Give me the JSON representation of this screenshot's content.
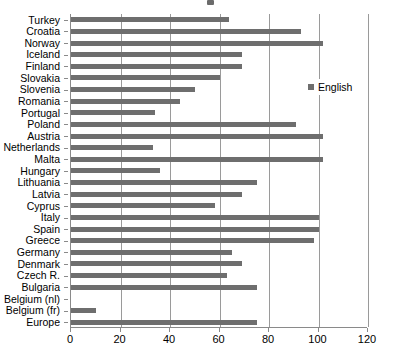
{
  "chart_data": {
    "type": "bar",
    "orientation": "horizontal",
    "title": "",
    "xlabel": "",
    "ylabel": "",
    "xlim": [
      0,
      120
    ],
    "xticks": [
      0,
      20,
      40,
      60,
      80,
      100,
      120
    ],
    "xtick_labels": [
      "0",
      "20",
      "40",
      "60",
      "80",
      "100",
      "120"
    ],
    "grid": true,
    "grid_axis": "x",
    "legend": {
      "position": "right",
      "entries": [
        {
          "label": "English",
          "color": "#6e6e6e"
        }
      ]
    },
    "series": [
      {
        "name": "English",
        "color": "#6e6e6e",
        "values": [
          64,
          93,
          102,
          69,
          69,
          60,
          50,
          44,
          34,
          91,
          102,
          33,
          102,
          36,
          75,
          69,
          58,
          100,
          100,
          98,
          65,
          69,
          63,
          75,
          0,
          10,
          75
        ]
      }
    ],
    "categories": [
      "Turkey",
      "Croatia",
      "Norway",
      "Iceland",
      "Finland",
      "Slovakia",
      "Slovenia",
      "Romania",
      "Portugal",
      "Poland",
      "Austria",
      "Netherlands",
      "Malta",
      "Hungary",
      "Lithuania",
      "Latvia",
      "Cyprus",
      "Italy",
      "Spain",
      "Greece",
      "Germany",
      "Denmark",
      "Czech R.",
      "Bulgaria",
      "Belgium (nl)",
      "Belgium (fr)",
      "Europe"
    ]
  },
  "colors": {
    "bar": "#6e6e6e",
    "axis": "#8a8a8a",
    "grid": "#9a9a9a",
    "text": "#000000",
    "background": "#ffffff"
  }
}
